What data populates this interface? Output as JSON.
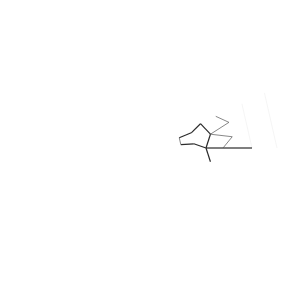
{
  "diagram": {
    "title": "Radial symmetric network graph",
    "center": [
      150,
      148
    ],
    "symmetry": 14,
    "angle_offset_deg": 0,
    "colors": {
      "background": "#ffffff",
      "stroke": "#2a2a2a",
      "node_fill": "#ffffff",
      "dot": "#444444"
    },
    "hub": {
      "ring_radius": 19,
      "center_node_radius": 4,
      "spoke_count": 24
    },
    "rings": [
      {
        "name": "outer-ring",
        "radius": 127,
        "node_radius": 5,
        "angle_shift_deg": 0,
        "class": "node-outer"
      },
      {
        "name": "second-ring",
        "radius": 102,
        "node_radius": 5,
        "angle_shift_deg": 0,
        "class": "node-outer"
      },
      {
        "name": "spoke-end-ring",
        "radius": 73,
        "node_radius": 4.2,
        "angle_shift_deg": 0,
        "class": "node"
      },
      {
        "name": "pair-ring-a",
        "radius": 83,
        "node_radius": 4.2,
        "angle_shift_deg": 7.8,
        "class": "node"
      },
      {
        "name": "pair-ring-b",
        "radius": 83,
        "node_radius": 4.2,
        "angle_shift_deg": 18.0,
        "class": "node"
      },
      {
        "name": "triangle-outer-ring",
        "radius": 62,
        "node_radius": 4.2,
        "angle_shift_deg": 12.86,
        "class": "node"
      },
      {
        "name": "mid-ring",
        "radius": 56,
        "node_radius": 4.2,
        "angle_shift_deg": 0,
        "class": "node"
      },
      {
        "name": "triangle-inner-ring",
        "radius": 44,
        "node_radius": 4,
        "angle_shift_deg": 5.5,
        "class": "node"
      },
      {
        "name": "triangle-inner-ring-b",
        "radius": 44,
        "node_radius": 4,
        "angle_shift_deg": 20.2,
        "class": "node"
      },
      {
        "name": "inner-ring-a",
        "radius": 31,
        "node_radius": 3.8,
        "angle_shift_deg": 6.4,
        "class": "node"
      },
      {
        "name": "inner-ring-b",
        "radius": 31,
        "node_radius": 3.8,
        "angle_shift_deg": 19.3,
        "class": "node"
      }
    ],
    "dots": [
      {
        "radius": 113,
        "angle_shift_deg": 8.5,
        "size": 0.9
      },
      {
        "radius": 113,
        "angle_shift_deg": 17.2,
        "size": 0.9
      },
      {
        "radius": 121,
        "angle_shift_deg": 12.86,
        "size": 0.8
      },
      {
        "radius": 92,
        "angle_shift_deg": 12.86,
        "size": 1.4
      },
      {
        "radius": 52,
        "angle_shift_deg": 12.86,
        "size": 1.5
      },
      {
        "radius": 67,
        "angle_shift_deg": 4,
        "size": 0.7
      },
      {
        "radius": 67,
        "angle_shift_deg": 21.7,
        "size": 0.7
      },
      {
        "radius": 38,
        "angle_shift_deg": 0,
        "size": 0.7
      }
    ]
  }
}
